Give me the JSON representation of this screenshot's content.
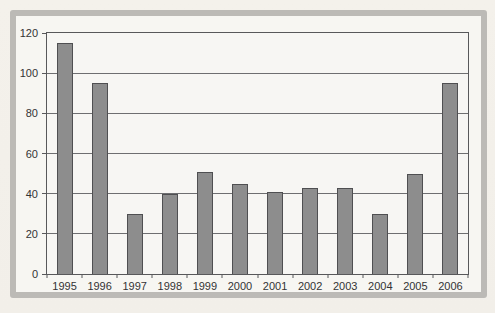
{
  "chart_data": {
    "type": "bar",
    "categories": [
      "1995",
      "1996",
      "1997",
      "1998",
      "1999",
      "2000",
      "2001",
      "2002",
      "2003",
      "2004",
      "2005",
      "2006"
    ],
    "values": [
      115,
      95,
      30,
      40,
      51,
      45,
      41,
      43,
      43,
      30,
      50,
      95
    ],
    "title": "",
    "xlabel": "",
    "ylabel": "",
    "ylim": [
      0,
      120
    ],
    "yticks": [
      0,
      20,
      40,
      60,
      80,
      100,
      120
    ],
    "grid": true,
    "legend": false,
    "colors": {
      "bar_fill": "#8d8d8d",
      "bar_border": "#4f4f51",
      "gridline": "#6e6e70",
      "plot_border": "#58585a",
      "plot_background": "#f7f6f3",
      "card_background": "#f7f6f2",
      "frame_border": "#bcbab6",
      "page_background": "#f3f0ea",
      "label_text": "#333334"
    }
  }
}
